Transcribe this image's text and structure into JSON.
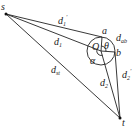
{
  "diagram": {
    "points": {
      "s": {
        "label": "s",
        "x": 6,
        "y": 14
      },
      "t": {
        "label": "t",
        "x": 120,
        "y": 118
      },
      "O": {
        "label": "O",
        "x": 101,
        "y": 51
      },
      "a": {
        "label": "a",
        "x": 102,
        "y": 37
      },
      "b": {
        "label": "b",
        "x": 115,
        "y": 52
      }
    },
    "circle": {
      "cx": 101,
      "cy": 51,
      "r": 14
    },
    "labels": {
      "d1p": {
        "base": "d",
        "sub": "1",
        "prime": "′"
      },
      "d1": {
        "base": "d",
        "sub": "1"
      },
      "dab": {
        "base": "d",
        "sub": "ab"
      },
      "theta": "θ",
      "alpha": "α",
      "d2p": {
        "base": "d",
        "sub": "2",
        "prime": "′"
      },
      "d2": {
        "base": "d",
        "sub": "2"
      },
      "dst": {
        "base": "d",
        "sub": "st"
      }
    },
    "line_color": "#222222"
  }
}
